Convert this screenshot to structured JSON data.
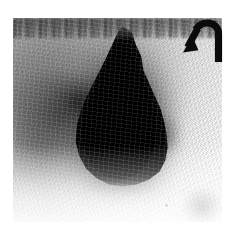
{
  "figure": {
    "kind": "grayscale-nuclear-medicine-scan",
    "modality_appearance": "scintigraphy / planar gamma-camera image",
    "orientation_note": "portrait-square plate on white page margin",
    "page_background_color": "#ffffff",
    "plate": {
      "background_color": "#e9e9e9",
      "lightest_tone": "#fdfdfd",
      "midtone": "#b4b4b4",
      "darkest_tone": "#000000",
      "left": 13,
      "top": 18,
      "width": 209,
      "height": 204
    },
    "features": [
      {
        "name": "focal-uptake-mass",
        "description": "large intensely black flame/pear-shaped focus of tracer uptake, narrow superiorly and broad inferiorly, located slightly left of the plate centre",
        "tone": "#000000",
        "center_x": 105,
        "center_y": 103,
        "approx_width": 100,
        "approx_height": 140
      },
      {
        "name": "left-flank-uptake",
        "description": "softer mid-grey region of increased activity along the left side of the plate",
        "tone": "#5a5a5a",
        "center_x": 55,
        "center_y": 112
      },
      {
        "name": "superior-noise-band",
        "description": "speckled dark horizontal band of noise at the top edge of the acquisition field",
        "tone": "#2a2a2a",
        "center_y": 26
      },
      {
        "name": "inferior-right-blob",
        "description": "faint grey blob of low-level activity in the lower right quadrant",
        "tone": "#7a7a7a",
        "center_x": 196,
        "center_y": 201
      },
      {
        "name": "right-field-background",
        "description": "near-white low-count background occupying the right third of the plate",
        "tone": "#f8f8f8"
      }
    ],
    "annotations": [
      {
        "name": "hooked-arrow-marker",
        "icon": "curved-arrow-down-left-icon",
        "description": "thick black J-shaped arrow in the upper right corner; vertical shaft rises on the right, hooks over to the left at the top, then the barbed head points down and to the left toward the uptake focus",
        "color": "#0b0b0b",
        "left": 180,
        "top": 19,
        "width": 46,
        "height": 44,
        "points_toward": "focal-uptake-mass"
      }
    ],
    "text_labels": [],
    "scale_bar": null
  }
}
